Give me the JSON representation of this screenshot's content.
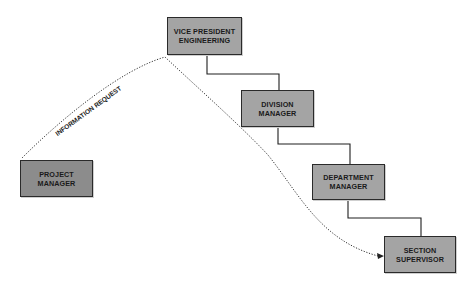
{
  "diagram": {
    "nodes": [
      {
        "id": "vp",
        "lines": [
          "VICE PRESIDENT",
          "ENGINEERING"
        ],
        "x": 167,
        "y": 17,
        "w": 75,
        "h": 38,
        "fill": "#a4a4a4"
      },
      {
        "id": "division",
        "lines": [
          "DIVISION",
          "MANAGER"
        ],
        "x": 241,
        "y": 90,
        "w": 73,
        "h": 37,
        "fill": "#a4a4a4"
      },
      {
        "id": "department",
        "lines": [
          "DEPARTMENT",
          "MANAGER"
        ],
        "x": 312,
        "y": 164,
        "w": 73,
        "h": 36,
        "fill": "#a4a4a4"
      },
      {
        "id": "section",
        "lines": [
          "SECTION",
          "SUPERVISOR"
        ],
        "x": 384,
        "y": 236,
        "w": 72,
        "h": 37,
        "fill": "#a4a4a4"
      },
      {
        "id": "project",
        "lines": [
          "PROJECT",
          "MANAGER"
        ],
        "x": 20,
        "y": 160,
        "w": 73,
        "h": 37,
        "fill": "#8c8c8c"
      }
    ],
    "hierarchy_connectors": [
      {
        "from": "vp",
        "to": "division"
      },
      {
        "from": "division",
        "to": "department"
      },
      {
        "from": "department",
        "to": "section"
      }
    ],
    "flow": {
      "from": "project",
      "to": "section",
      "style": "dotted",
      "label": "INFORMATION REQUEST"
    },
    "colors": {
      "line": "#1e1e1e",
      "text": "#1a1a1a"
    }
  }
}
